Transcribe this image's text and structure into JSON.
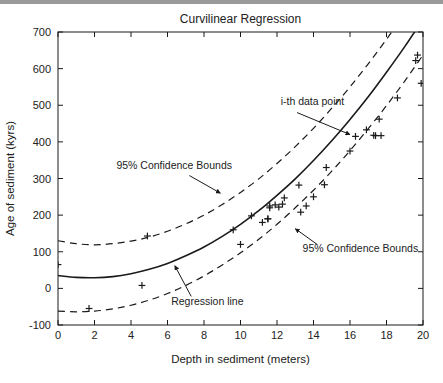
{
  "figure": {
    "title": "Curvilinear Regression",
    "background_color": "#ffffff",
    "top_bar_color": "#9a9a9a",
    "line_color": "#1a1a1a",
    "text_color": "#222222"
  },
  "chart_data": {
    "type": "scatter",
    "title": "Curvilinear Regression",
    "xlabel": "Depth in sediment (meters)",
    "ylabel": "Age of sediment (kyrs)",
    "xlim": [
      0,
      20
    ],
    "ylim": [
      -100,
      700
    ],
    "xticks": [
      0,
      2,
      4,
      6,
      8,
      10,
      12,
      14,
      16,
      18,
      20
    ],
    "yticks": [
      -100,
      0,
      100,
      200,
      300,
      400,
      500,
      600,
      700
    ],
    "xticklabels": [
      "0",
      "2",
      "4",
      "6",
      "8",
      "10",
      "12",
      "14",
      "16",
      "18",
      "20"
    ],
    "yticklabels": [
      "-100",
      "0",
      "100",
      "200",
      "300",
      "400",
      "500",
      "600",
      "700"
    ],
    "grid": false,
    "legend": false,
    "series": [
      {
        "name": "i-th data point",
        "marker": "plus",
        "x": [
          0.0,
          1.7,
          4.6,
          4.9,
          9.6,
          10.0,
          10.6,
          11.2,
          11.5,
          11.5,
          11.6,
          11.6,
          11.9,
          12.1,
          12.3,
          12.4,
          13.2,
          13.3,
          13.6,
          14.0,
          14.6,
          14.7,
          16.0,
          16.3,
          16.9,
          17.3,
          17.4,
          17.6,
          17.7,
          18.6,
          19.6,
          19.7,
          19.9
        ],
        "y": [
          65,
          -55,
          8,
          143,
          160,
          120,
          198,
          180,
          190,
          190,
          225,
          220,
          228,
          222,
          230,
          247,
          282,
          208,
          225,
          250,
          283,
          330,
          375,
          415,
          433,
          418,
          417,
          462,
          417,
          520,
          622,
          637,
          560
        ]
      },
      {
        "name": "Regression line",
        "type": "line",
        "style": "solid",
        "x": [
          0,
          1,
          2,
          3,
          4,
          5,
          6,
          7,
          8,
          9,
          10,
          11,
          12,
          13,
          14,
          15,
          16,
          17,
          18,
          19,
          20
        ],
        "y": [
          35,
          30,
          29,
          32,
          40,
          52,
          68,
          89,
          113,
          142,
          175,
          212,
          254,
          299,
          349,
          403,
          461,
          523,
          590,
          660,
          735
        ]
      },
      {
        "name": "95% Confidence Bounds upper",
        "type": "line",
        "style": "dashed",
        "x": [
          0,
          1,
          2,
          3,
          4,
          5,
          6,
          7,
          8,
          9,
          10,
          11,
          12,
          13,
          14,
          15,
          16,
          17,
          18,
          19,
          20
        ],
        "y": [
          130,
          122,
          119,
          122,
          129,
          140,
          156,
          176,
          200,
          229,
          262,
          299,
          341,
          387,
          437,
          492,
          550,
          613,
          680,
          751,
          826
        ]
      },
      {
        "name": "95% Confidence Bounds lower",
        "type": "line",
        "style": "dashed",
        "x": [
          0,
          1,
          2,
          3,
          4,
          5,
          6,
          7,
          8,
          9,
          10,
          11,
          12,
          13,
          14,
          15,
          16,
          17,
          18,
          19,
          20
        ],
        "y": [
          -62,
          -64,
          -62,
          -56,
          -46,
          -32,
          -14,
          8,
          34,
          64,
          97,
          134,
          175,
          220,
          268,
          320,
          376,
          436,
          499,
          566,
          637
        ]
      }
    ],
    "annotations": [
      {
        "id": "annotation-ith-data-point",
        "text": "i-th data point",
        "text_x": 12.2,
        "text_y": 500,
        "arrow_from_x": 13.1,
        "arrow_from_y": 480,
        "arrow_to_x": 16.0,
        "arrow_to_y": 420
      },
      {
        "id": "annotation-upper-bounds",
        "text": "95% Confidence Bounds",
        "text_x": 3.2,
        "text_y": 327,
        "arrow_from_x": 7.2,
        "arrow_from_y": 308,
        "arrow_to_x": 8.9,
        "arrow_to_y": 260
      },
      {
        "id": "annotation-lower-bounds",
        "text": "95% Confidence Bounds",
        "text_x": 13.4,
        "text_y": 98,
        "arrow_from_x": 14.2,
        "arrow_from_y": 120,
        "arrow_to_x": 13.0,
        "arrow_to_y": 163
      },
      {
        "id": "annotation-regression-line",
        "text": "Regression line",
        "text_x": 6.2,
        "text_y": -45,
        "arrow_from_x": 7.3,
        "arrow_from_y": -22,
        "arrow_to_x": 6.4,
        "arrow_to_y": 62
      }
    ]
  }
}
